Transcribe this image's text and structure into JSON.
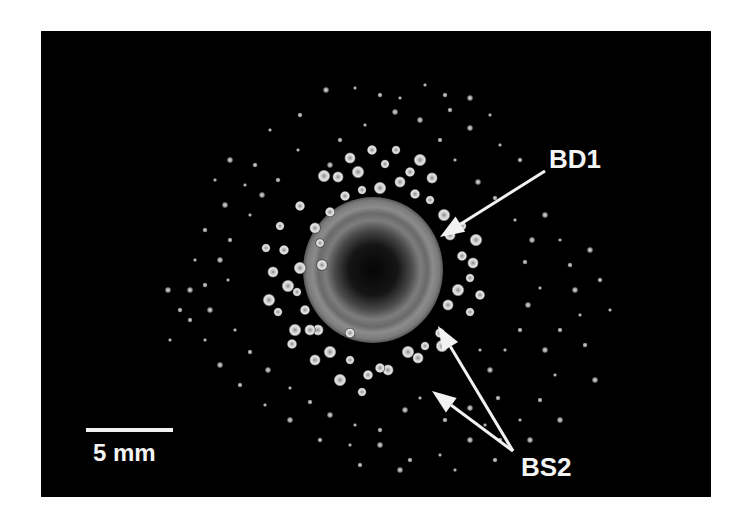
{
  "figure": {
    "background": "#000000",
    "frame": {
      "x": 41,
      "y": 31,
      "w": 670,
      "h": 466
    },
    "colony": {
      "center": [
        373,
        270
      ],
      "outer_radius": [
        70,
        73
      ],
      "core_radius": 36,
      "rim_color": "#8a8a8a",
      "core_color": "#0a0a0a"
    },
    "labels": {
      "bd1": {
        "text": "BD1",
        "x": 549,
        "y": 146
      },
      "bs2": {
        "text": "BS2",
        "x": 521,
        "y": 454
      },
      "scale": {
        "text": "5 mm",
        "x": 93,
        "y": 441
      }
    },
    "scale_bar": {
      "x": 86,
      "y": 428,
      "w": 87,
      "h": 4
    },
    "arrows": [
      {
        "name": "bd1-arrow",
        "from": [
          545,
          171
        ],
        "to": [
          440,
          237
        ]
      },
      {
        "name": "bs2-arrow-upper",
        "from": [
          513,
          451
        ],
        "to": [
          438,
          326
        ]
      },
      {
        "name": "bs2-arrow-lower",
        "from": [
          513,
          451
        ],
        "to": [
          432,
          391
        ]
      }
    ],
    "large_dots": [
      [
        320,
        243
      ],
      [
        330,
        212
      ],
      [
        315,
        228
      ],
      [
        300,
        268
      ],
      [
        297,
        292
      ],
      [
        305,
        310
      ],
      [
        318,
        330
      ],
      [
        330,
        352
      ],
      [
        350,
        360
      ],
      [
        368,
        375
      ],
      [
        388,
        370
      ],
      [
        408,
        352
      ],
      [
        425,
        346
      ],
      [
        440,
        333
      ],
      [
        448,
        305
      ],
      [
        458,
        290
      ],
      [
        470,
        278
      ],
      [
        462,
        256
      ],
      [
        450,
        235
      ],
      [
        444,
        215
      ],
      [
        430,
        200
      ],
      [
        415,
        194
      ],
      [
        400,
        182
      ],
      [
        380,
        188
      ],
      [
        362,
        190
      ],
      [
        345,
        196
      ],
      [
        338,
        177
      ],
      [
        358,
        172
      ],
      [
        385,
        164
      ],
      [
        410,
        172
      ],
      [
        432,
        178
      ],
      [
        420,
        160
      ],
      [
        396,
        150
      ],
      [
        372,
        150
      ],
      [
        350,
        158
      ],
      [
        324,
        176
      ],
      [
        280,
        226
      ],
      [
        284,
        250
      ],
      [
        273,
        272
      ],
      [
        288,
        286
      ],
      [
        278,
        312
      ],
      [
        292,
        344
      ],
      [
        315,
        360
      ],
      [
        340,
        380
      ],
      [
        362,
        392
      ],
      [
        380,
        368
      ],
      [
        418,
        358
      ],
      [
        442,
        346
      ],
      [
        470,
        312
      ],
      [
        480,
        295
      ],
      [
        473,
        263
      ],
      [
        476,
        240
      ],
      [
        462,
        226
      ],
      [
        300,
        206
      ],
      [
        322,
        265
      ],
      [
        269,
        300
      ],
      [
        266,
        248
      ],
      [
        350,
        333
      ],
      [
        310,
        330
      ],
      [
        295,
        330
      ]
    ],
    "small_dots": [
      [
        270,
        130
      ],
      [
        300,
        115
      ],
      [
        326,
        90
      ],
      [
        355,
        88
      ],
      [
        380,
        95
      ],
      [
        395,
        112
      ],
      [
        365,
        125
      ],
      [
        340,
        140
      ],
      [
        330,
        165
      ],
      [
        298,
        150
      ],
      [
        278,
        180
      ],
      [
        262,
        195
      ],
      [
        250,
        215
      ],
      [
        230,
        240
      ],
      [
        220,
        260
      ],
      [
        228,
        280
      ],
      [
        205,
        285
      ],
      [
        210,
        310
      ],
      [
        235,
        330
      ],
      [
        250,
        352
      ],
      [
        268,
        370
      ],
      [
        290,
        388
      ],
      [
        310,
        402
      ],
      [
        330,
        415
      ],
      [
        355,
        425
      ],
      [
        380,
        430
      ],
      [
        405,
        410
      ],
      [
        420,
        398
      ],
      [
        445,
        420
      ],
      [
        470,
        408
      ],
      [
        485,
        425
      ],
      [
        498,
        398
      ],
      [
        490,
        370
      ],
      [
        505,
        350
      ],
      [
        520,
        330
      ],
      [
        528,
        305
      ],
      [
        540,
        288
      ],
      [
        525,
        262
      ],
      [
        532,
        240
      ],
      [
        515,
        220
      ],
      [
        495,
        198
      ],
      [
        478,
        182
      ],
      [
        455,
        160
      ],
      [
        440,
        140
      ],
      [
        420,
        120
      ],
      [
        400,
        98
      ],
      [
        450,
        110
      ],
      [
        470,
        128
      ],
      [
        500,
        145
      ],
      [
        520,
        160
      ],
      [
        545,
        215
      ],
      [
        560,
        240
      ],
      [
        570,
        265
      ],
      [
        575,
        290
      ],
      [
        580,
        315
      ],
      [
        560,
        330
      ],
      [
        545,
        350
      ],
      [
        555,
        375
      ],
      [
        540,
        400
      ],
      [
        560,
        420
      ],
      [
        520,
        420
      ],
      [
        500,
        440
      ],
      [
        470,
        440
      ],
      [
        440,
        455
      ],
      [
        410,
        460
      ],
      [
        380,
        445
      ],
      [
        350,
        445
      ],
      [
        320,
        440
      ],
      [
        290,
        420
      ],
      [
        265,
        405
      ],
      [
        240,
        385
      ],
      [
        220,
        365
      ],
      [
        205,
        340
      ],
      [
        190,
        320
      ],
      [
        190,
        290
      ],
      [
        195,
        260
      ],
      [
        205,
        230
      ],
      [
        225,
        205
      ],
      [
        245,
        185
      ],
      [
        255,
        165
      ],
      [
        230,
        160
      ],
      [
        215,
        180
      ],
      [
        180,
        310
      ],
      [
        168,
        290
      ],
      [
        170,
        340
      ],
      [
        600,
        280
      ],
      [
        590,
        250
      ],
      [
        610,
        310
      ],
      [
        585,
        345
      ],
      [
        595,
        380
      ],
      [
        425,
        85
      ],
      [
        445,
        95
      ],
      [
        470,
        98
      ],
      [
        490,
        115
      ],
      [
        360,
        465
      ],
      [
        400,
        470
      ],
      [
        455,
        470
      ],
      [
        495,
        460
      ],
      [
        530,
        440
      ],
      [
        480,
        350
      ]
    ]
  }
}
